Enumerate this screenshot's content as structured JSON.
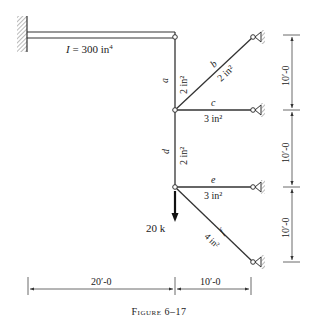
{
  "figure": {
    "caption": "Figure 6–17",
    "beam": {
      "label": "I = 300 in⁴"
    },
    "members": [
      {
        "id": "a",
        "name": "a",
        "area": ""
      },
      {
        "id": "b",
        "name": "b",
        "area": "2 in²"
      },
      {
        "id": "c",
        "name": "c",
        "area": "3 in²"
      },
      {
        "id": "d",
        "name": "d",
        "area": "2 in²"
      },
      {
        "id": "e",
        "name": "e",
        "area": "3 in²"
      },
      {
        "id": "f",
        "name": "f",
        "area": "4 in²"
      }
    ],
    "a_area": "2 in²",
    "load": {
      "label": "20 k"
    },
    "dimensions": {
      "vertical": [
        "10′-0",
        "10′-0",
        "10′-0"
      ],
      "horizontal": [
        "20′-0",
        "10′-0"
      ]
    }
  }
}
